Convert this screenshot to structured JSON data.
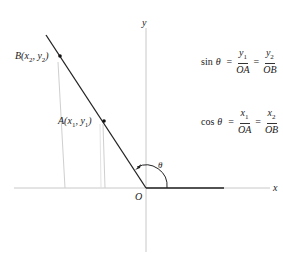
{
  "diagram": {
    "axes": {
      "x_label": "x",
      "y_label": "y",
      "origin_label": "O"
    },
    "points": [
      {
        "name": "B",
        "label_name": "B",
        "coord_open": "(x",
        "sub1": "2",
        "mid": ", y",
        "sub2": "2",
        "close": ")"
      },
      {
        "name": "A",
        "label_name": "A",
        "coord_open": "(x",
        "sub1": "1",
        "mid": ", y",
        "sub2": "1",
        "close": ")"
      }
    ],
    "angle_label": "θ",
    "formulas": {
      "sin": {
        "fn": "sin",
        "theta": "θ",
        "eq": "=",
        "frac1": {
          "num": "y",
          "num_sub": "1",
          "den": "OA"
        },
        "frac2": {
          "num": "y",
          "num_sub": "2",
          "den": "OB"
        }
      },
      "cos": {
        "fn": "cos",
        "theta": "θ",
        "eq": "=",
        "frac1": {
          "num": "x",
          "num_sub": "1",
          "den": "OA"
        },
        "frac2": {
          "num": "x",
          "num_sub": "2",
          "den": "OB"
        }
      }
    }
  }
}
